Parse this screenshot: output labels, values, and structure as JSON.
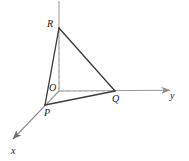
{
  "figure": {
    "type": "3d-coordinate-diagram",
    "canvas": {
      "width": 189,
      "height": 161
    },
    "colors": {
      "axis": "#9a9a9a",
      "triangle_edge": "#3b3b3b",
      "dashed_guide": "#b0b0b0",
      "dashed_guide_faint": "#c8c8c8",
      "label_text": "#1a1a1a",
      "background": "#ffffff"
    },
    "axes": [
      {
        "name": "x-axis",
        "label": "x",
        "label_pos": {
          "x": 11,
          "y": 146
        },
        "from": {
          "x": 59,
          "y": 91
        },
        "to": {
          "x": 9,
          "y": 143
        },
        "arrow": true
      },
      {
        "name": "y-axis",
        "label": "y",
        "label_pos": {
          "x": 170,
          "y": 91
        },
        "from": {
          "x": 59,
          "y": 91
        },
        "to": {
          "x": 178,
          "y": 90
        },
        "arrow": true
      },
      {
        "name": "z-axis",
        "label": "",
        "label_pos": null,
        "from": {
          "x": 59,
          "y": 91
        },
        "to": {
          "x": 59,
          "y": 1
        },
        "arrow": false
      }
    ],
    "origin": {
      "name": "O",
      "label": "O",
      "x": 59,
      "y": 91
    },
    "vertices": [
      {
        "name": "R",
        "label": "R",
        "x": 59,
        "y": 28,
        "label_pos": {
          "x": 47,
          "y": 19
        },
        "axis": "z"
      },
      {
        "name": "P",
        "label": "P",
        "x": 45,
        "y": 105,
        "label_pos": {
          "x": 44,
          "y": 108
        },
        "axis": "x"
      },
      {
        "name": "Q",
        "label": "Q",
        "x": 115,
        "y": 91,
        "label_pos": {
          "x": 112,
          "y": 94
        },
        "axis": "y"
      }
    ],
    "solid_edges": [
      {
        "name": "edge-R-P",
        "from": "R",
        "to": "P"
      },
      {
        "name": "edge-P-Q",
        "from": "P",
        "to": "Q"
      },
      {
        "name": "edge-Q-R",
        "from": "Q",
        "to": "R"
      }
    ],
    "dashed_segments": [
      {
        "name": "guide-R-O",
        "from": "R",
        "to": "O",
        "style": "dashed"
      },
      {
        "name": "guide-O-Q",
        "from": "O",
        "to": "Q",
        "style": "dashed"
      },
      {
        "name": "guide-O-P",
        "from": "O",
        "to": "P",
        "style": "dashed-faint"
      }
    ]
  }
}
